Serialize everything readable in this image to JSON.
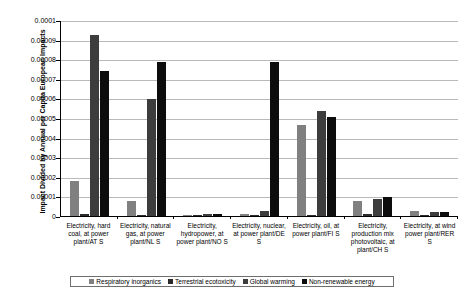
{
  "chart_data": {
    "type": "bar",
    "title": "",
    "xlabel": "",
    "ylabel": "Impact Divided by Annual per Capita European Impacts",
    "ylim": [
      0,
      0.0001
    ],
    "ytick_labels": [
      "0.0001",
      "0.00009",
      "0.00008",
      "0.00007",
      "0.00006",
      "0.00005",
      "0.00004",
      "0.00003",
      "0.00002",
      "0.00001",
      "0"
    ],
    "ytick_values": [
      0.0001,
      9e-05,
      8e-05,
      7e-05,
      6e-05,
      5e-05,
      4e-05,
      3e-05,
      2e-05,
      1e-05,
      0
    ],
    "grid": true,
    "legend_position": "bottom",
    "categories": [
      "Electricity, hard coal, at power plant/AT S",
      "Electricity, natural gas, at power plant/NL S",
      "Electricity, hydropower, at power plant/NO S",
      "Electricity, nuclear, at power plant/DE S",
      "Electricity, oil, at power plant/FI S",
      "Electricity, production mix photovoltaic, at plant/CH S",
      "Electricity, at wind power plant/RER S"
    ],
    "series": [
      {
        "name": "Respiratory inorganics",
        "color": "#808080",
        "values": [
          1.8e-05,
          7.5e-06,
          4e-07,
          1e-06,
          4.65e-05,
          7.8e-06,
          2.5e-06
        ]
      },
      {
        "name": "Terrestrial ecotoxicity",
        "color": "#2b2b2b",
        "values": [
          8e-07,
          6e-07,
          2e-07,
          4e-07,
          3e-07,
          1e-06,
          2e-07
        ]
      },
      {
        "name": "Global warming",
        "color": "#3d3d3d",
        "values": [
          9.22e-05,
          5.95e-05,
          1e-06,
          2.5e-06,
          5.35e-05,
          8.5e-06,
          2e-06
        ]
      },
      {
        "name": "Non-renewable energy",
        "color": "#0d0d0d",
        "values": [
          7.42e-05,
          7.85e-05,
          8e-07,
          7.85e-05,
          5.05e-05,
          9.8e-06,
          1.8e-06
        ]
      }
    ]
  },
  "legend": {
    "items": [
      {
        "label": "Respiratory inorganics",
        "color": "#808080"
      },
      {
        "label": "Terrestrial ecotoxicity",
        "color": "#2b2b2b"
      },
      {
        "label": "Global warming",
        "color": "#3d3d3d"
      },
      {
        "label": "Non-renewable energy",
        "color": "#0d0d0d"
      }
    ]
  }
}
